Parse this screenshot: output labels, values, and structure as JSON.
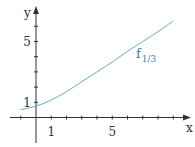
{
  "chart_data": {
    "type": "line",
    "title": "",
    "xlabel": "x",
    "ylabel": "y",
    "xlim": [
      -1.2,
      10
    ],
    "ylim": [
      -0.3,
      7
    ],
    "x_ticks": [
      -1,
      0,
      1,
      2,
      3,
      4,
      5,
      6,
      7,
      8,
      9
    ],
    "y_ticks": [
      0,
      1,
      2,
      3,
      4,
      5,
      6
    ],
    "x_tick_labels": [
      {
        "value": 1,
        "label": "1"
      },
      {
        "value": 5,
        "label": "5"
      }
    ],
    "y_tick_labels": [
      {
        "value": 1,
        "label": "1"
      },
      {
        "value": 5,
        "label": "5"
      }
    ],
    "grid": false,
    "series": [
      {
        "name": "f_{1/3}",
        "label_main": "f",
        "label_sub": "1/3",
        "color": "#6aa6d6",
        "x": [
          -1,
          0,
          1,
          2,
          3,
          4,
          5,
          6,
          7,
          8,
          9
        ],
        "y": [
          0.52,
          0.75,
          1.15,
          1.7,
          2.35,
          3.0,
          3.65,
          4.35,
          5.0,
          5.65,
          6.35
        ]
      }
    ]
  },
  "colors": {
    "axis": "#333333",
    "curve": "#6aa6d6",
    "label": "#3a7fb5"
  }
}
